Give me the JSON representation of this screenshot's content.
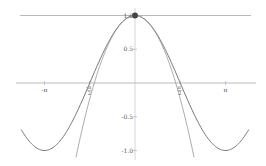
{
  "chart_data": {
    "type": "line",
    "title": "",
    "xlabel": "",
    "ylabel": "",
    "xlim": [
      -3.95,
      3.95
    ],
    "ylim": [
      -1.1,
      1.05
    ],
    "grid": false,
    "legend": null,
    "x_ticks": [
      {
        "value": -3.14159,
        "label": "-π"
      },
      {
        "value": -1.5708,
        "label": "-π/2"
      },
      {
        "value": 1.5708,
        "label": "π/2"
      },
      {
        "value": 3.14159,
        "label": "π"
      }
    ],
    "y_ticks": [
      {
        "value": 1.0,
        "label": "1.0"
      },
      {
        "value": 0.5,
        "label": "0.5"
      },
      {
        "value": -0.5,
        "label": "-0.5"
      },
      {
        "value": -1.0,
        "label": "-1.0"
      }
    ],
    "series": [
      {
        "name": "cos(x)",
        "expression": "cos(x)",
        "color": "#777777"
      },
      {
        "name": "degree-0 Taylor approximation",
        "expression": "1",
        "color": "#999999"
      },
      {
        "name": "degree-2 Taylor approximation",
        "expression": "1 - x^2/2",
        "color": "#888888"
      }
    ],
    "annotations": [
      {
        "type": "point",
        "x": 0,
        "y": 1,
        "label": "expansion point"
      }
    ]
  }
}
